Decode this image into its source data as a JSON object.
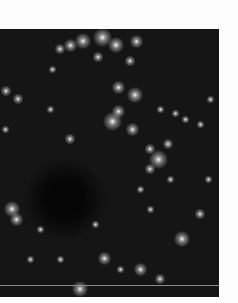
{
  "image": {
    "description": "grayscale dark-field fluorescence image with bright point sources arranged in arc-like filaments",
    "colors": {
      "background": "#151515",
      "border": "#fdfdfd",
      "spot": "#ffffff"
    },
    "spots": [
      [
        83,
        12,
        6
      ],
      [
        102,
        8,
        7
      ],
      [
        116,
        16,
        6
      ],
      [
        70,
        16,
        5
      ],
      [
        60,
        20,
        4
      ],
      [
        136,
        12,
        5
      ],
      [
        130,
        32,
        4
      ],
      [
        98,
        28,
        4
      ],
      [
        118,
        58,
        5
      ],
      [
        135,
        66,
        6
      ],
      [
        118,
        82,
        5
      ],
      [
        112,
        92,
        7
      ],
      [
        132,
        100,
        5
      ],
      [
        158,
        130,
        7
      ],
      [
        150,
        120,
        4
      ],
      [
        168,
        115,
        4
      ],
      [
        160,
        80,
        3
      ],
      [
        175,
        84,
        3
      ],
      [
        185,
        90,
        3
      ],
      [
        200,
        95,
        3
      ],
      [
        210,
        70,
        3
      ],
      [
        150,
        140,
        4
      ],
      [
        170,
        150,
        3
      ],
      [
        140,
        160,
        3
      ],
      [
        6,
        62,
        4
      ],
      [
        18,
        70,
        4
      ],
      [
        52,
        40,
        3
      ],
      [
        70,
        110,
        4
      ],
      [
        50,
        80,
        3
      ],
      [
        12,
        180,
        6
      ],
      [
        16,
        190,
        5
      ],
      [
        30,
        230,
        3
      ],
      [
        104,
        229,
        5
      ],
      [
        80,
        260,
        6
      ],
      [
        140,
        240,
        5
      ],
      [
        160,
        250,
        4
      ],
      [
        182,
        210,
        6
      ],
      [
        200,
        185,
        4
      ],
      [
        208,
        150,
        3
      ],
      [
        120,
        240,
        3
      ],
      [
        60,
        230,
        3
      ],
      [
        40,
        200,
        3
      ],
      [
        95,
        195,
        3
      ],
      [
        150,
        180,
        3
      ],
      [
        5,
        100,
        3
      ]
    ]
  }
}
